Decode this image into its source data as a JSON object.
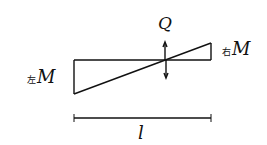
{
  "diagram": {
    "type": "bending-moment-and-shear-diagram",
    "shear_label": "Q",
    "left_moment": {
      "prefix": "左",
      "symbol": "M"
    },
    "right_moment": {
      "prefix": "右",
      "symbol": "M"
    },
    "span_label": "l"
  }
}
